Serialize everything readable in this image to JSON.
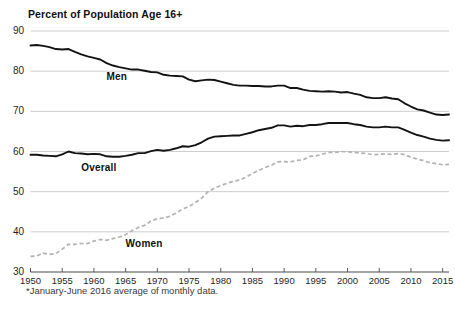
{
  "chart_data": {
    "type": "line",
    "title": "Percent of Population Age 16+",
    "subtitle": "",
    "xlabel": "",
    "ylabel": "",
    "footnote": "*January-June 2016 average of monthly data.",
    "xlim": [
      1950,
      2016
    ],
    "ylim": [
      30,
      90
    ],
    "yticks": [
      30,
      40,
      50,
      60,
      70,
      80,
      90
    ],
    "xticks": [
      1950,
      1955,
      1960,
      1965,
      1970,
      1975,
      1980,
      1985,
      1990,
      1995,
      2000,
      2005,
      2010,
      2015
    ],
    "grid": true,
    "legend_position": "inline-labels",
    "x": [
      1950,
      1951,
      1952,
      1953,
      1954,
      1955,
      1956,
      1957,
      1958,
      1959,
      1960,
      1961,
      1962,
      1963,
      1964,
      1965,
      1966,
      1967,
      1968,
      1969,
      1970,
      1971,
      1972,
      1973,
      1974,
      1975,
      1976,
      1977,
      1978,
      1979,
      1980,
      1981,
      1982,
      1983,
      1984,
      1985,
      1986,
      1987,
      1988,
      1989,
      1990,
      1991,
      1992,
      1993,
      1994,
      1995,
      1996,
      1997,
      1998,
      1999,
      2000,
      2001,
      2002,
      2003,
      2004,
      2005,
      2006,
      2007,
      2008,
      2009,
      2010,
      2011,
      2012,
      2013,
      2014,
      2015,
      2016
    ],
    "series": [
      {
        "name": "Men",
        "label": "Men",
        "style": "solid",
        "color": "#131313",
        "values": [
          86.4,
          86.5,
          86.3,
          86.0,
          85.5,
          85.4,
          85.5,
          84.8,
          84.2,
          83.7,
          83.3,
          82.9,
          82.0,
          81.4,
          81.0,
          80.7,
          80.4,
          80.4,
          80.1,
          79.8,
          79.7,
          79.1,
          78.9,
          78.8,
          78.7,
          77.9,
          77.5,
          77.7,
          77.9,
          77.8,
          77.4,
          77.0,
          76.6,
          76.4,
          76.4,
          76.3,
          76.3,
          76.2,
          76.2,
          76.4,
          76.4,
          75.8,
          75.8,
          75.4,
          75.1,
          75.0,
          74.9,
          75.0,
          74.9,
          74.7,
          74.8,
          74.4,
          74.1,
          73.5,
          73.3,
          73.3,
          73.5,
          73.2,
          73.0,
          72.0,
          71.2,
          70.5,
          70.2,
          69.7,
          69.2,
          69.1,
          69.2
        ]
      },
      {
        "name": "Overall",
        "label": "Overall",
        "style": "solid",
        "color": "#131313",
        "values": [
          59.2,
          59.2,
          59.0,
          58.9,
          58.8,
          59.3,
          60.0,
          59.6,
          59.5,
          59.3,
          59.4,
          59.3,
          58.8,
          58.7,
          58.7,
          58.9,
          59.2,
          59.6,
          59.6,
          60.1,
          60.4,
          60.2,
          60.4,
          60.8,
          61.3,
          61.2,
          61.6,
          62.3,
          63.2,
          63.7,
          63.8,
          63.9,
          64.0,
          64.0,
          64.4,
          64.8,
          65.3,
          65.6,
          65.9,
          66.5,
          66.5,
          66.2,
          66.4,
          66.3,
          66.6,
          66.6,
          66.8,
          67.1,
          67.1,
          67.1,
          67.1,
          66.8,
          66.6,
          66.2,
          66.0,
          66.0,
          66.2,
          66.0,
          66.0,
          65.4,
          64.7,
          64.1,
          63.7,
          63.2,
          62.9,
          62.7,
          62.8
        ]
      },
      {
        "name": "Women",
        "label": "Women",
        "style": "dashed",
        "color": "#b2b2b2",
        "values": [
          33.9,
          34.0,
          34.7,
          34.4,
          34.6,
          35.7,
          36.9,
          36.9,
          37.1,
          37.1,
          37.7,
          38.1,
          37.9,
          38.3,
          38.7,
          39.3,
          40.3,
          41.1,
          41.6,
          42.7,
          43.3,
          43.4,
          43.9,
          44.7,
          45.7,
          46.3,
          47.3,
          48.4,
          50.0,
          50.9,
          51.5,
          52.1,
          52.6,
          52.9,
          53.6,
          54.5,
          55.3,
          56.0,
          56.6,
          57.4,
          57.5,
          57.4,
          57.8,
          57.9,
          58.8,
          58.9,
          59.3,
          59.8,
          59.8,
          60.0,
          59.9,
          59.8,
          59.6,
          59.5,
          59.2,
          59.3,
          59.4,
          59.3,
          59.5,
          59.2,
          58.6,
          58.1,
          57.7,
          57.2,
          57.0,
          56.7,
          56.8
        ]
      }
    ],
    "annotations": [
      {
        "text": "Men",
        "x": 1962,
        "y": 78.5
      },
      {
        "text": "Overall",
        "x": 1958,
        "y": 56.0
      },
      {
        "text": "Women",
        "x": 1965,
        "y": 37.0
      }
    ]
  },
  "axis": {
    "y_tick_labels": [
      "90",
      "80",
      "70",
      "60",
      "50",
      "40",
      "30"
    ],
    "x_tick_labels": [
      "1950",
      "1955",
      "1960",
      "1965",
      "1970",
      "1975",
      "1980",
      "1985",
      "1990",
      "1995",
      "2000",
      "2005",
      "2010",
      "2015"
    ]
  },
  "colors": {
    "men_line": "#131313",
    "overall_line": "#131313",
    "women_line": "#b2b2b2",
    "gridline": "#b9b9b9",
    "axis": "#4a4a4a",
    "text": "#1a1a1a",
    "background": "#ffffff"
  }
}
